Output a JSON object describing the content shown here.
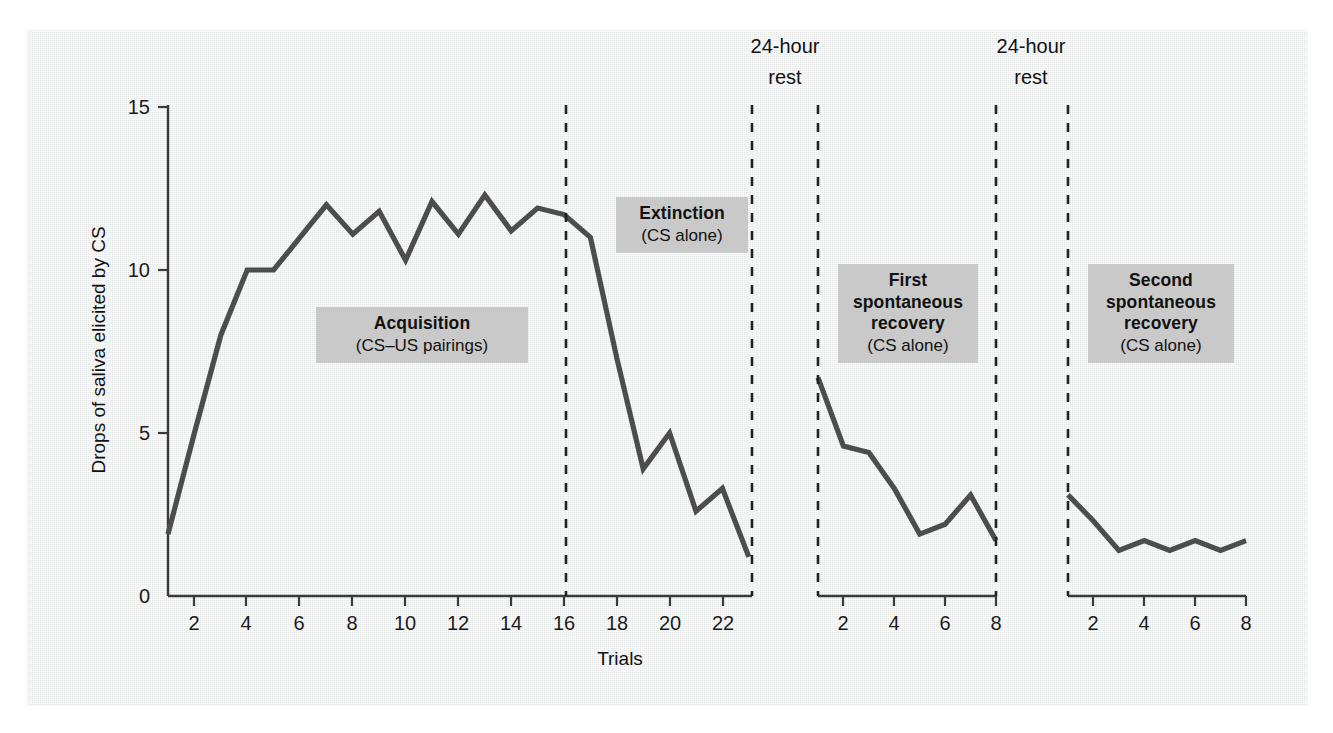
{
  "figure": {
    "background_color": "#edeeee",
    "line_color": "#4d4d4d",
    "annotation_box_color": "#c9c9c9"
  },
  "axes": {
    "y_label": "Drops of saliva elicited by CS",
    "x_label": "Trials",
    "y_ticks": [
      "0",
      "5",
      "10",
      "15"
    ],
    "panel1_x_ticks": [
      "2",
      "4",
      "6",
      "8",
      "10",
      "12",
      "14",
      "16",
      "18",
      "20",
      "22"
    ],
    "panel2_x_ticks": [
      "2",
      "4",
      "6",
      "8"
    ],
    "panel3_x_ticks": [
      "2",
      "4",
      "6",
      "8"
    ]
  },
  "annotations": {
    "acquisition": {
      "title": "Acquisition",
      "subtitle": "(CS–US pairings)"
    },
    "extinction": {
      "title": "Extinction",
      "subtitle": "(CS alone)"
    },
    "first_recovery": {
      "title": "First\nspontaneous\nrecovery",
      "title_line1": "First",
      "title_line2": "spontaneous",
      "title_line3": "recovery",
      "subtitle": "(CS alone)"
    },
    "second_recovery": {
      "title_line1": "Second",
      "title_line2": "spontaneous",
      "title_line3": "recovery",
      "subtitle": "(CS alone)"
    },
    "rest1": {
      "line1": "24-hour",
      "line2": "rest"
    },
    "rest2": {
      "line1": "24-hour",
      "line2": "rest"
    }
  },
  "chart_data": {
    "type": "line",
    "title": "",
    "xlabel": "Trials",
    "ylabel": "Drops of saliva elicited by CS",
    "ylim": [
      0,
      15
    ],
    "grid": false,
    "legend": "none",
    "panels": [
      {
        "name": "Acquisition and Extinction",
        "phases": [
          "Acquisition (CS-US pairings): trials 1-16",
          "Extinction (CS alone): trials 17-23"
        ],
        "xlim": [
          1,
          23
        ],
        "x": [
          1,
          2,
          3,
          4,
          5,
          6,
          7,
          8,
          9,
          10,
          11,
          12,
          13,
          14,
          15,
          16,
          17,
          18,
          19,
          20,
          21,
          22,
          23
        ],
        "values": [
          1.9,
          5.0,
          8.0,
          10.0,
          10.0,
          11.0,
          12.0,
          11.1,
          11.8,
          10.3,
          12.1,
          11.1,
          12.3,
          11.2,
          11.9,
          11.7,
          11.0,
          7.3,
          3.9,
          5.0,
          2.6,
          3.3,
          1.2
        ]
      },
      {
        "name": "First spontaneous recovery (CS alone)",
        "xlim": [
          1,
          8
        ],
        "x": [
          1,
          2,
          3,
          4,
          5,
          6,
          7,
          8
        ],
        "values": [
          6.7,
          4.6,
          4.4,
          3.3,
          1.9,
          2.2,
          3.1,
          1.7
        ]
      },
      {
        "name": "Second spontaneous recovery (CS alone)",
        "xlim": [
          1,
          8
        ],
        "x": [
          1,
          2,
          3,
          4,
          5,
          6,
          7,
          8
        ],
        "values": [
          3.1,
          2.3,
          1.4,
          1.7,
          1.4,
          1.7,
          1.4,
          1.7
        ]
      }
    ],
    "dividers": [
      {
        "label": "acquisition-extinction boundary",
        "at_x": 16.0,
        "panel": 1
      },
      {
        "label": "24-hour rest",
        "at_x": 23.0,
        "panel": 1
      },
      {
        "label": "24-hour rest",
        "at_x": 1.0,
        "panel": 2
      },
      {
        "label": "24-hour rest",
        "at_x": 8.0,
        "panel": 2
      },
      {
        "label": "24-hour rest",
        "at_x": 1.0,
        "panel": 3
      }
    ]
  }
}
